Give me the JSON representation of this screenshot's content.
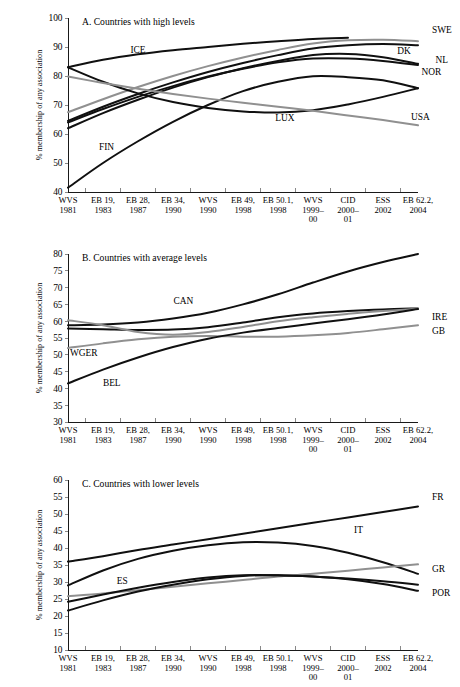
{
  "figure": {
    "background": "#ffffff",
    "line_color_dark": "#101010",
    "line_color_gray": "#909090",
    "axis_color": "#000000",
    "header_sliver": ""
  },
  "axis": {
    "ylabel": "% membership of any association",
    "categories": [
      {
        "l1": "WVS",
        "l2": "1981",
        "l3": ""
      },
      {
        "l1": "EB 19,",
        "l2": "1983",
        "l3": ""
      },
      {
        "l1": "EB 28,",
        "l2": "1987",
        "l3": ""
      },
      {
        "l1": "EB 34,",
        "l2": "1990",
        "l3": ""
      },
      {
        "l1": "WVS",
        "l2": "1990",
        "l3": ""
      },
      {
        "l1": "EB 49,",
        "l2": "1998",
        "l3": ""
      },
      {
        "l1": "EB 50.1,",
        "l2": "1998",
        "l3": ""
      },
      {
        "l1": "WVS",
        "l2": "1999–",
        "l3": "00"
      },
      {
        "l1": "CID",
        "l2": "2000–",
        "l3": "01"
      },
      {
        "l1": "ESS",
        "l2": "2002",
        "l3": ""
      },
      {
        "l1": "EB 62.2,",
        "l2": "2004",
        "l3": ""
      }
    ]
  },
  "chart_data": [
    {
      "type": "line",
      "id": "panel-a",
      "title": "A. Countries with high levels",
      "xlabel": "",
      "ylabel": "% membership of any association",
      "ylim": [
        40,
        100
      ],
      "yticks": [
        40,
        50,
        60,
        70,
        80,
        90,
        100
      ],
      "grid": false,
      "legend": "inline-labels",
      "x": [
        "WVS 1981",
        "EB 19, 1983",
        "EB 28, 1987",
        "EB 34, 1990",
        "WVS 1990",
        "EB 49, 1998",
        "EB 50.1, 1998",
        "WVS 1999–00",
        "CID 2000–01",
        "ESS 2002",
        "EB 62.2, 2004"
      ],
      "series": [
        {
          "name": "ICE",
          "color": "#101010",
          "label_x": 2.0,
          "label_y": 88.0,
          "values": [
            83.0,
            85.6,
            87.5,
            88.9,
            90.0,
            91.1,
            92.0,
            92.8,
            93.2,
            null,
            null
          ]
        },
        {
          "name": "SWE",
          "color": "#909090",
          "label_x": 10.4,
          "label_y": 95.0,
          "values": [
            67.5,
            72.0,
            76.2,
            80.0,
            83.4,
            86.4,
            89.0,
            91.2,
            92.3,
            92.5,
            92.0
          ]
        },
        {
          "name": "DK",
          "color": "#101010",
          "label_x": 9.6,
          "label_y": 87.5,
          "values": [
            64.5,
            69.4,
            73.8,
            77.8,
            81.4,
            84.5,
            87.2,
            89.5,
            90.6,
            91.0,
            90.6
          ]
        },
        {
          "name": "NL",
          "color": "#101010",
          "label_x": 10.5,
          "label_y": 84.5,
          "values": [
            62.0,
            67.2,
            71.8,
            76.0,
            79.6,
            82.7,
            85.2,
            87.2,
            87.6,
            86.5,
            84.2
          ]
        },
        {
          "name": "NOR",
          "color": "#101010",
          "label_x": 10.1,
          "label_y": 80.5,
          "values": [
            64.0,
            68.6,
            72.8,
            76.5,
            79.8,
            82.5,
            84.7,
            86.0,
            86.0,
            85.2,
            83.8
          ]
        },
        {
          "name": "FIN",
          "color": "#101010",
          "label_x": 1.1,
          "label_y": 54.5,
          "values": [
            41.5,
            50.0,
            57.5,
            64.2,
            70.0,
            74.8,
            78.0,
            79.9,
            79.6,
            78.5,
            75.8
          ]
        },
        {
          "name": "LUX",
          "color": "#101010",
          "label_x": 6.2,
          "label_y": 64.5,
          "values": [
            83.0,
            78.0,
            74.0,
            71.0,
            69.0,
            67.8,
            67.4,
            68.2,
            70.2,
            72.8,
            75.8
          ]
        },
        {
          "name": "USA",
          "color": "#909090",
          "label_x": 9.8,
          "label_y": 65.0,
          "values": [
            79.8,
            77.6,
            75.6,
            73.8,
            72.2,
            70.8,
            69.4,
            68.0,
            66.4,
            64.8,
            63.0
          ]
        }
      ]
    },
    {
      "type": "line",
      "id": "panel-b",
      "title": "B. Countries with average levels",
      "xlabel": "",
      "ylabel": "% membership of any association",
      "ylim": [
        30,
        80
      ],
      "yticks": [
        30,
        35,
        40,
        45,
        50,
        55,
        60,
        65,
        70,
        75,
        80
      ],
      "grid": false,
      "legend": "inline-labels",
      "x": [
        "WVS 1981",
        "EB 19, 1983",
        "EB 28, 1987",
        "EB 34, 1990",
        "WVS 1990",
        "EB 49, 1998",
        "EB 50.1, 1998",
        "WVS 1999–00",
        "CID 2000–01",
        "ESS 2002",
        "EB 62.2, 2004"
      ],
      "series": [
        {
          "name": "CAN",
          "color": "#101010",
          "label_x": 3.3,
          "label_y": 65.2,
          "values": [
            58.8,
            59.0,
            59.6,
            60.8,
            62.5,
            65.0,
            68.0,
            71.5,
            74.8,
            77.6,
            80.0
          ]
        },
        {
          "name": "IRE",
          "color": "#101010",
          "label_x": 10.4,
          "label_y": 60.5,
          "values": [
            57.8,
            57.6,
            57.4,
            57.5,
            58.2,
            59.6,
            61.2,
            62.3,
            63.0,
            63.5,
            63.8
          ]
        },
        {
          "name": "GB",
          "color": "#909090",
          "label_x": 10.4,
          "label_y": 56.2,
          "values": [
            52.0,
            53.4,
            54.6,
            55.4,
            55.6,
            55.4,
            55.4,
            55.8,
            56.5,
            57.6,
            58.8
          ]
        },
        {
          "name": "WGER",
          "color": "#909090",
          "label_x": 0.45,
          "label_y": 49.5,
          "values": [
            60.3,
            58.8,
            56.8,
            56.0,
            56.8,
            58.3,
            60.0,
            61.2,
            62.2,
            63.0,
            63.7
          ]
        },
        {
          "name": "BEL",
          "color": "#101010",
          "label_x": 1.25,
          "label_y": 40.8,
          "values": [
            41.5,
            45.6,
            49.2,
            52.3,
            54.8,
            56.6,
            58.0,
            59.3,
            60.6,
            62.0,
            63.6
          ]
        }
      ]
    },
    {
      "type": "line",
      "id": "panel-c",
      "title": "C. Countries with lower levels",
      "xlabel": "",
      "ylabel": "% membership of any association",
      "ylim": [
        10,
        60
      ],
      "yticks": [
        10,
        15,
        20,
        25,
        30,
        35,
        40,
        45,
        50,
        55,
        60
      ],
      "grid": false,
      "legend": "inline-labels",
      "x": [
        "WVS 1981",
        "EB 19, 1983",
        "EB 28, 1987",
        "EB 34, 1990",
        "WVS 1990",
        "EB 49, 1998",
        "EB 50.1, 1998",
        "WVS 1999–00",
        "CID 2000–01",
        "ESS 2002",
        "EB 62.2, 2004"
      ],
      "series": [
        {
          "name": "FR",
          "color": "#101010",
          "label_x": 10.4,
          "label_y": 54.0,
          "values": [
            36.0,
            37.6,
            39.4,
            41.0,
            42.6,
            44.2,
            45.8,
            47.4,
            49.0,
            50.6,
            52.2
          ]
        },
        {
          "name": "IT",
          "color": "#101010",
          "label_x": 8.3,
          "label_y": 44.5,
          "values": [
            29.0,
            33.4,
            36.8,
            39.2,
            40.8,
            41.7,
            41.6,
            40.6,
            38.6,
            35.8,
            32.4
          ]
        },
        {
          "name": "GR",
          "color": "#909090",
          "label_x": 10.4,
          "label_y": 33.0,
          "values": [
            25.8,
            26.6,
            27.6,
            28.6,
            29.6,
            30.6,
            31.6,
            32.4,
            33.3,
            34.3,
            35.2
          ]
        },
        {
          "name": "ES",
          "color": "#101010",
          "label_x": 1.55,
          "label_y": 29.5,
          "values": [
            24.2,
            26.3,
            28.3,
            30.0,
            31.3,
            32.0,
            32.0,
            31.6,
            31.0,
            30.2,
            29.2
          ]
        },
        {
          "name": "POR",
          "color": "#101010",
          "label_x": 10.4,
          "label_y": 26.0,
          "values": [
            21.6,
            24.6,
            27.2,
            29.2,
            30.8,
            31.8,
            32.0,
            31.6,
            30.8,
            29.4,
            27.4
          ]
        }
      ]
    }
  ]
}
